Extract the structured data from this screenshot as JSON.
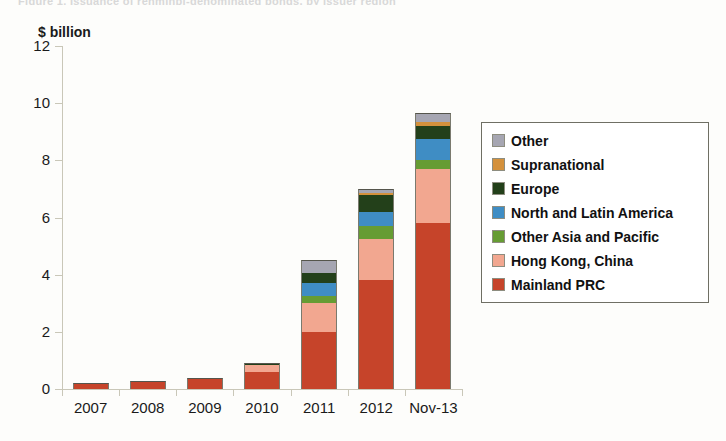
{
  "top_cut_text": "Figure 1. Issuance of renminbi-denominated bonds, by issuer region",
  "axis_title": "$ billion",
  "chart_data": {
    "type": "bar",
    "title": "$ billion",
    "xlabel": "",
    "ylabel": "$ billion",
    "ylim": [
      0,
      12
    ],
    "yticks": [
      0,
      2,
      4,
      6,
      8,
      10,
      12
    ],
    "grid": false,
    "stacked": true,
    "legend_position": "right",
    "categories": [
      "2007",
      "2008",
      "2009",
      "2010",
      "2011",
      "2012",
      "Nov-13"
    ],
    "series": [
      {
        "name": "Mainland PRC",
        "color": "#c6442a",
        "values": [
          0.2,
          0.28,
          0.38,
          0.6,
          2.0,
          3.8,
          5.8
        ]
      },
      {
        "name": "Hong Kong, China",
        "color": "#f2a790",
        "values": [
          0.0,
          0.0,
          0.0,
          0.25,
          1.0,
          1.45,
          1.9
        ]
      },
      {
        "name": "Other Asia  and Pacific",
        "color": "#669c33",
        "values": [
          0.0,
          0.0,
          0.0,
          0.0,
          0.25,
          0.45,
          0.3
        ]
      },
      {
        "name": "North and Latin America",
        "color": "#3f8dc4",
        "values": [
          0.0,
          0.0,
          0.0,
          0.0,
          0.45,
          0.5,
          0.75
        ]
      },
      {
        "name": "Europe",
        "color": "#23401a",
        "values": [
          0.0,
          0.0,
          0.0,
          0.05,
          0.35,
          0.6,
          0.45
        ]
      },
      {
        "name": "Supranational",
        "color": "#d4913c",
        "values": [
          0.0,
          0.0,
          0.0,
          0.0,
          0.0,
          0.05,
          0.15
        ]
      },
      {
        "name": "Other",
        "color": "#a6a6b2",
        "values": [
          0.0,
          0.0,
          0.0,
          0.0,
          0.45,
          0.15,
          0.3
        ]
      }
    ],
    "legend_order_top_to_bottom": [
      "Other",
      "Supranational",
      "Europe",
      "North and Latin America",
      "Other Asia  and Pacific",
      "Hong Kong, China",
      "Mainland PRC"
    ],
    "totals": [
      0.2,
      0.28,
      0.38,
      0.9,
      4.5,
      7.0,
      9.6
    ]
  }
}
